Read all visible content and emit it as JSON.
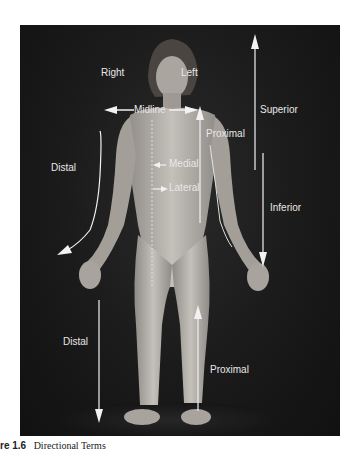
{
  "figure": {
    "caption_number": "re 1.6",
    "caption_title": "Directional Terms",
    "labels": {
      "right": "Right",
      "left": "Left",
      "midline": "Midline",
      "proximal_arm": "Proximal",
      "superior": "Superior",
      "distal_arm": "Distal",
      "medial": "Medial",
      "lateral": "Lateral",
      "inferior": "Inferior",
      "distal_leg": "Distal",
      "proximal_leg": "Proximal"
    },
    "colors": {
      "background": "#1a1a1a",
      "label": "#e8e8e8",
      "arrow": "#f2f2f2",
      "skin": "#b8b3ad"
    }
  }
}
